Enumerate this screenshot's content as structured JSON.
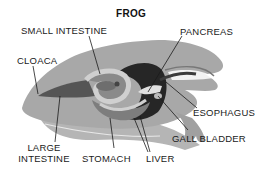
{
  "diagram": {
    "title": "FROG",
    "labels": {
      "small_intestine": "SMALL INTESTINE",
      "pancreas": "PANCREAS",
      "cloaca": "CLOACA",
      "esophagus": "ESOPHAGUS",
      "gall_bladder": "GALL BLADDER",
      "large_intestine_line1": "LARGE",
      "large_intestine_line2": "INTESTINE",
      "stomach": "STOMACH",
      "liver": "LIVER"
    },
    "colors": {
      "body": "#a9a9a9",
      "body_shadow": "#8f8f8f",
      "liver": "#2a2a2a",
      "intestine": "#7a7a7a",
      "light_organ": "#d4d4d4",
      "leader_line": "#1a1a1a"
    }
  }
}
